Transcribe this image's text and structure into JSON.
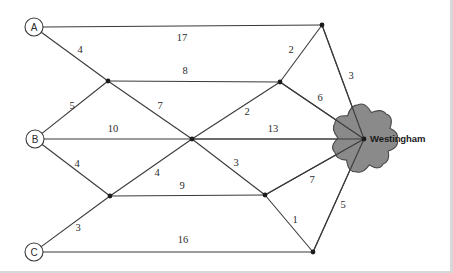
{
  "diagram": {
    "hub": {
      "name": "Westingham",
      "x": 364,
      "y": 139,
      "label_x": 370,
      "label_y": 134
    },
    "colors": {
      "line": "#3a3a3a",
      "blob_fill": "#8a8a8a",
      "blob_stroke": "#4a4a4a",
      "node_fill": "#ffffff",
      "text": "#2b2b2b",
      "background": "#ffffff"
    },
    "terminals": [
      {
        "id": "A",
        "label": "A",
        "x": 34,
        "y": 27,
        "r": 9
      },
      {
        "id": "B",
        "label": "B",
        "x": 35,
        "y": 139,
        "r": 9
      },
      {
        "id": "C",
        "label": "C",
        "x": 34,
        "y": 252,
        "r": 9
      }
    ],
    "junctions": [
      {
        "id": "n1",
        "x": 108,
        "y": 81
      },
      {
        "id": "n2",
        "x": 110,
        "y": 196
      },
      {
        "id": "n3",
        "x": 192,
        "y": 139
      },
      {
        "id": "n4",
        "x": 280,
        "y": 82
      },
      {
        "id": "n5",
        "x": 265,
        "y": 195
      },
      {
        "id": "n6",
        "x": 322,
        "y": 25
      },
      {
        "id": "n7",
        "x": 313,
        "y": 252
      }
    ],
    "edges": [
      {
        "id": "e-a-n6",
        "from": "A",
        "to": "n6",
        "weight": "17",
        "label_x": 182,
        "label_y": 38
      },
      {
        "id": "e-a-n1",
        "from": "A",
        "to": "n1",
        "weight": "4",
        "label_x": 80,
        "label_y": 50
      },
      {
        "id": "e-n1-n4",
        "from": "n1",
        "to": "n4",
        "weight": "8",
        "label_x": 185,
        "label_y": 71
      },
      {
        "id": "e-b-n1",
        "from": "B",
        "to": "n1",
        "weight": "5",
        "label_x": 72,
        "label_y": 106
      },
      {
        "id": "e-n1-n3",
        "from": "n1",
        "to": "n3",
        "weight": "7",
        "label_x": 160,
        "label_y": 106
      },
      {
        "id": "e-b-n3",
        "from": "B",
        "to": "n3",
        "weight": "10",
        "label_x": 113,
        "label_y": 129
      },
      {
        "id": "e-n3-hub",
        "from": "n3",
        "to": "hub",
        "weight": "13",
        "label_x": 273,
        "label_y": 129
      },
      {
        "id": "e-b-n2",
        "from": "B",
        "to": "n2",
        "weight": "4",
        "label_x": 77,
        "label_y": 164
      },
      {
        "id": "e-n2-n3",
        "from": "n2",
        "to": "n3",
        "weight": "4",
        "label_x": 157,
        "label_y": 173
      },
      {
        "id": "e-n2-n5",
        "from": "n2",
        "to": "n5",
        "weight": "9",
        "label_x": 182,
        "label_y": 186
      },
      {
        "id": "e-c-n2",
        "from": "C",
        "to": "n2",
        "weight": "3",
        "label_x": 78,
        "label_y": 228
      },
      {
        "id": "e-c-n7",
        "from": "C",
        "to": "n7",
        "weight": "16",
        "label_x": 183,
        "label_y": 240
      },
      {
        "id": "e-n3-n4",
        "from": "n3",
        "to": "n4",
        "weight": "2",
        "label_x": 247,
        "label_y": 112
      },
      {
        "id": "e-n3-n5",
        "from": "n3",
        "to": "n5",
        "weight": "3",
        "label_x": 236,
        "label_y": 163
      },
      {
        "id": "e-n4-n6",
        "from": "n4",
        "to": "n6",
        "weight": "2",
        "label_x": 291,
        "label_y": 50
      },
      {
        "id": "e-n4-hub",
        "from": "n4",
        "to": "hub",
        "weight": "6",
        "label_x": 320,
        "label_y": 98
      },
      {
        "id": "e-n6-hub",
        "from": "n6",
        "to": "hub",
        "weight": "3",
        "label_x": 351,
        "label_y": 76
      },
      {
        "id": "e-n5-hub",
        "from": "n5",
        "to": "hub",
        "weight": "7",
        "label_x": 312,
        "label_y": 180
      },
      {
        "id": "e-n5-n7",
        "from": "n5",
        "to": "n7",
        "weight": "1",
        "label_x": 295,
        "label_y": 220
      },
      {
        "id": "e-n7-hub",
        "from": "n7",
        "to": "hub",
        "weight": "5",
        "label_x": 343,
        "label_y": 205
      }
    ]
  }
}
